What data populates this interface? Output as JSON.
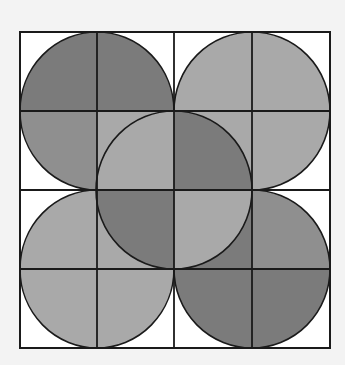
{
  "diagram": {
    "title": "Five overlapping circles on a 4x4 grid",
    "grid": {
      "x": [
        20,
        97,
        174,
        252,
        330
      ],
      "y": [
        32,
        111,
        190,
        269,
        348
      ],
      "stroke": "#1a1a1a",
      "background": "#ffffff"
    },
    "colors": {
      "dark": "#7b7b7b",
      "medium": "#8f8f8f",
      "light": "#a9a9a9",
      "white": "#ffffff",
      "page": "#f3f3f3"
    },
    "circles": [
      {
        "name": "top-left",
        "cx": 97,
        "cy": 111,
        "rx": 77,
        "ry": 79,
        "quadrants": {
          "tl": "dark",
          "tr": "dark",
          "bl": "medium",
          "br": "light"
        }
      },
      {
        "name": "top-right",
        "cx": 252,
        "cy": 111,
        "rx": 78,
        "ry": 79,
        "quadrants": {
          "tl": "light",
          "tr": "light",
          "bl": "light",
          "br": "light"
        }
      },
      {
        "name": "bottom-left",
        "cx": 97,
        "cy": 269,
        "rx": 77,
        "ry": 79,
        "quadrants": {
          "tl": "light",
          "tr": "light",
          "bl": "light",
          "br": "light"
        }
      },
      {
        "name": "bottom-right",
        "cx": 252,
        "cy": 269,
        "rx": 78,
        "ry": 79,
        "quadrants": {
          "tl": "dark",
          "tr": "medium",
          "bl": "dark",
          "br": "dark"
        }
      },
      {
        "name": "center",
        "cx": 174,
        "cy": 190,
        "rx": 78,
        "ry": 79,
        "quadrants": {
          "tl": "light",
          "tr": "dark",
          "bl": "dark",
          "br": "light"
        }
      }
    ]
  }
}
